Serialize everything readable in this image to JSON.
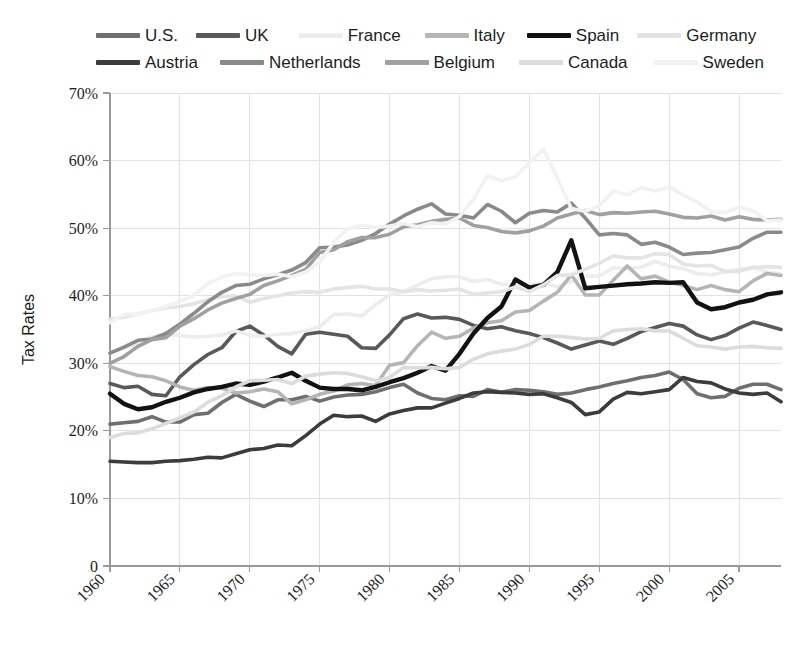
{
  "chart_data": {
    "type": "line",
    "title": "",
    "xlabel": "",
    "ylabel": "Tax Rates",
    "xlim": [
      1960,
      2008
    ],
    "ylim": [
      0,
      70
    ],
    "grid": true,
    "legend_position": "top",
    "x_ticks": [
      "1960",
      "1965",
      "1970",
      "1975",
      "1980",
      "1985",
      "1990",
      "1995",
      "2000",
      "2005"
    ],
    "x_tick_values": [
      1960,
      1965,
      1970,
      1975,
      1980,
      1985,
      1990,
      1995,
      2000,
      2005
    ],
    "y_ticks": [
      "0",
      "10%",
      "20%",
      "30%",
      "40%",
      "50%",
      "60%",
      "70%"
    ],
    "y_tick_values": [
      0,
      10,
      20,
      30,
      40,
      50,
      60,
      70
    ],
    "x": [
      1960,
      1961,
      1962,
      1963,
      1964,
      1965,
      1966,
      1967,
      1968,
      1969,
      1970,
      1971,
      1972,
      1973,
      1974,
      1975,
      1976,
      1977,
      1978,
      1979,
      1980,
      1981,
      1982,
      1983,
      1984,
      1985,
      1986,
      1987,
      1988,
      1989,
      1990,
      1991,
      1992,
      1993,
      1994,
      1995,
      1996,
      1997,
      1998,
      1999,
      2000,
      2001,
      2002,
      2003,
      2004,
      2005,
      2006,
      2007,
      2008
    ],
    "series": [
      {
        "name": "U.S.",
        "color": "#6f6f6f",
        "width": 3.6,
        "values": [
          21.0,
          21.2,
          21.4,
          22.1,
          21.3,
          21.3,
          22.4,
          22.6,
          24.2,
          25.4,
          24.4,
          23.6,
          24.6,
          24.6,
          25.1,
          24.4,
          25.0,
          25.3,
          25.4,
          25.8,
          26.4,
          26.9,
          25.6,
          24.8,
          24.6,
          25.2,
          25.1,
          26.1,
          25.7,
          26.1,
          26.0,
          25.8,
          25.4,
          25.6,
          26.1,
          26.5,
          27.0,
          27.4,
          27.9,
          28.2,
          28.7,
          27.6,
          25.5,
          24.9,
          25.1,
          26.3,
          26.9,
          26.9,
          26.1
        ]
      },
      {
        "name": "UK",
        "color": "#595959",
        "width": 3.6,
        "values": [
          27.0,
          26.4,
          26.6,
          25.4,
          25.2,
          28.0,
          29.8,
          31.3,
          32.3,
          34.7,
          35.5,
          34.2,
          32.5,
          31.4,
          34.3,
          34.6,
          34.3,
          34.0,
          32.3,
          32.2,
          34.2,
          36.6,
          37.3,
          36.7,
          36.8,
          36.5,
          35.6,
          35.1,
          35.4,
          34.8,
          34.4,
          33.8,
          33.0,
          32.1,
          32.7,
          33.3,
          32.8,
          33.7,
          34.7,
          35.3,
          35.9,
          35.5,
          34.2,
          33.5,
          34.1,
          35.2,
          36.1,
          35.6,
          35.0
        ]
      },
      {
        "name": "France",
        "color": "#ededed",
        "width": 3.6,
        "values": [
          31.5,
          32.3,
          32.8,
          33.9,
          34.3,
          34.1,
          33.9,
          34.0,
          34.2,
          34.8,
          34.1,
          34.0,
          34.3,
          34.4,
          34.8,
          35.4,
          37.2,
          37.3,
          37.0,
          38.7,
          40.1,
          40.6,
          41.6,
          42.5,
          42.8,
          42.8,
          42.1,
          42.4,
          41.7,
          41.5,
          41.6,
          41.9,
          41.3,
          42.1,
          42.9,
          42.9,
          44.1,
          44.1,
          44.2,
          45.1,
          44.4,
          44.0,
          43.3,
          43.1,
          43.5,
          43.9,
          44.1,
          43.5,
          43.2
        ]
      },
      {
        "name": "Italy",
        "color": "#b5b5b5",
        "width": 3.6,
        "values": [
          29.5,
          28.8,
          28.2,
          28.0,
          27.4,
          26.5,
          26.0,
          26.4,
          26.3,
          25.6,
          25.8,
          26.2,
          25.8,
          24.0,
          24.6,
          25.4,
          25.9,
          26.8,
          27.0,
          26.7,
          29.7,
          30.1,
          32.6,
          34.6,
          33.7,
          34.0,
          35.2,
          36.0,
          36.3,
          37.6,
          37.8,
          39.2,
          40.5,
          43.1,
          40.1,
          40.1,
          42.3,
          44.4,
          42.5,
          42.9,
          42.0,
          41.5,
          40.9,
          41.5,
          40.9,
          40.6,
          42.2,
          43.3,
          43.0
        ]
      },
      {
        "name": "Spain",
        "color": "#121212",
        "width": 4.4,
        "values": [
          25.5,
          24.0,
          23.2,
          23.5,
          24.3,
          24.9,
          25.7,
          26.2,
          26.5,
          27.0,
          26.8,
          27.3,
          27.9,
          28.6,
          27.4,
          26.4,
          26.2,
          26.2,
          26.0,
          26.5,
          27.2,
          27.8,
          28.6,
          29.6,
          28.9,
          31.4,
          34.4,
          36.7,
          38.4,
          42.4,
          41.2,
          41.6,
          43.5,
          48.2,
          41.1,
          41.3,
          41.5,
          41.7,
          41.8,
          42.0,
          41.9,
          42.0,
          39.0,
          38.0,
          38.3,
          39.0,
          39.4,
          40.2,
          40.5
        ]
      },
      {
        "name": "Germany",
        "color": "#e4e4e4",
        "width": 3.6,
        "values": [
          36.5,
          36.8,
          37.3,
          37.8,
          38.2,
          38.4,
          38.8,
          39.4,
          39.9,
          40.0,
          39.0,
          39.6,
          40.0,
          40.4,
          40.6,
          40.5,
          41.0,
          41.2,
          41.4,
          41.0,
          41.0,
          40.6,
          40.9,
          40.7,
          40.8,
          41.0,
          40.2,
          40.4,
          40.6,
          41.3,
          40.6,
          41.6,
          43.0,
          43.1,
          43.9,
          44.8,
          45.9,
          45.6,
          45.6,
          46.2,
          46.1,
          44.7,
          44.4,
          44.5,
          43.6,
          43.6,
          44.2,
          44.3,
          44.2
        ]
      },
      {
        "name": "Austria",
        "color": "#3c3c3c",
        "width": 3.6,
        "values": [
          15.5,
          15.4,
          15.3,
          15.3,
          15.5,
          15.6,
          15.8,
          16.1,
          16.0,
          16.6,
          17.2,
          17.4,
          17.9,
          17.8,
          19.3,
          21.0,
          22.3,
          22.1,
          22.2,
          21.4,
          22.5,
          23.0,
          23.4,
          23.4,
          24.1,
          24.8,
          25.6,
          25.8,
          25.7,
          25.6,
          25.4,
          25.5,
          24.9,
          24.2,
          22.4,
          22.8,
          24.7,
          25.7,
          25.5,
          25.8,
          26.1,
          27.9,
          27.3,
          27.1,
          26.2,
          25.6,
          25.4,
          25.6,
          24.3
        ]
      },
      {
        "name": "Netherlands",
        "color": "#8a8a8a",
        "width": 3.6,
        "values": [
          31.5,
          32.4,
          33.4,
          33.6,
          34.4,
          35.8,
          37.4,
          39.1,
          40.5,
          41.5,
          41.7,
          42.5,
          43.1,
          43.8,
          44.9,
          47.1,
          47.2,
          47.5,
          48.2,
          49.2,
          50.6,
          51.8,
          52.8,
          53.6,
          52.1,
          51.9,
          51.5,
          53.5,
          52.5,
          50.8,
          52.2,
          52.6,
          52.4,
          53.7,
          51.5,
          49.0,
          49.2,
          49.0,
          47.6,
          47.9,
          47.2,
          46.1,
          46.3,
          46.4,
          46.8,
          47.2,
          48.5,
          49.4,
          49.4
        ]
      },
      {
        "name": "Belgium",
        "color": "#a0a0a0",
        "width": 3.6,
        "values": [
          30.0,
          31.0,
          32.5,
          33.5,
          33.8,
          35.5,
          36.6,
          37.9,
          38.9,
          39.6,
          40.2,
          41.5,
          42.2,
          43.0,
          43.9,
          46.4,
          46.8,
          48.0,
          48.6,
          48.6,
          49.1,
          50.2,
          50.5,
          51.0,
          51.3,
          51.5,
          50.4,
          50.1,
          49.5,
          49.3,
          49.6,
          50.3,
          51.5,
          52.1,
          52.6,
          52.0,
          52.3,
          52.2,
          52.4,
          52.5,
          52.1,
          51.6,
          51.5,
          51.8,
          51.2,
          51.7,
          51.3,
          51.2,
          51.3
        ]
      },
      {
        "name": "Canada",
        "color": "#dcdcdc",
        "width": 3.6,
        "values": [
          19.0,
          19.6,
          19.7,
          20.3,
          21.1,
          21.9,
          22.8,
          24.2,
          25.2,
          26.5,
          27.4,
          27.5,
          27.6,
          27.0,
          28.1,
          28.4,
          28.6,
          28.5,
          28.0,
          27.4,
          27.9,
          29.4,
          29.3,
          29.4,
          29.2,
          29.4,
          30.6,
          31.4,
          31.8,
          32.1,
          32.8,
          34.0,
          34.0,
          33.8,
          33.6,
          33.7,
          34.8,
          35.0,
          35.1,
          34.8,
          34.8,
          33.7,
          32.6,
          32.4,
          32.1,
          32.4,
          32.5,
          32.3,
          32.2
        ]
      },
      {
        "name": "Sweden",
        "color": "#f2f2f2",
        "width": 3.6,
        "values": [
          36.0,
          37.2,
          37.3,
          37.8,
          38.4,
          39.2,
          40.0,
          41.8,
          42.8,
          43.3,
          43.1,
          43.0,
          43.2,
          42.8,
          43.5,
          45.0,
          47.9,
          49.9,
          50.4,
          50.1,
          50.3,
          50.7,
          50.2,
          50.8,
          50.6,
          51.7,
          54.3,
          57.8,
          57.0,
          57.6,
          59.7,
          61.7,
          57.4,
          52.9,
          52.5,
          53.3,
          55.5,
          54.9,
          56.0,
          55.5,
          56.1,
          54.9,
          53.9,
          52.4,
          52.3,
          53.1,
          52.6,
          51.1,
          51.2
        ]
      }
    ]
  },
  "legend": {
    "row1": [
      {
        "label": "U.S.",
        "color": "#6f6f6f"
      },
      {
        "label": "UK",
        "color": "#595959"
      },
      {
        "label": "France",
        "color": "#ededed"
      },
      {
        "label": "Italy",
        "color": "#b5b5b5"
      },
      {
        "label": "Spain",
        "color": "#121212"
      },
      {
        "label": "Germany",
        "color": "#e4e4e4"
      }
    ],
    "row2": [
      {
        "label": "Austria",
        "color": "#3c3c3c"
      },
      {
        "label": "Netherlands",
        "color": "#8a8a8a"
      },
      {
        "label": "Belgium",
        "color": "#a0a0a0"
      },
      {
        "label": "Canada",
        "color": "#dcdcdc"
      },
      {
        "label": "Sweden",
        "color": "#f2f2f2"
      }
    ]
  },
  "axes": {
    "y_title": "Tax Rates"
  }
}
